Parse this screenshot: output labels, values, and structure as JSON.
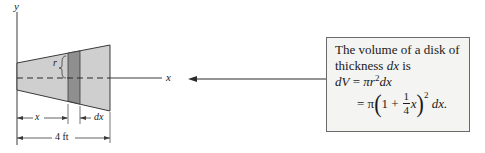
{
  "figure": {
    "axes": {
      "y_label": "y",
      "x_label": "x"
    },
    "annotations": {
      "radius_label": "r",
      "x_dim_label": "x",
      "dx_dim_label": "dx",
      "total_length_label": "4 ft"
    },
    "colors": {
      "solid_fill": "#cfcfcf",
      "disk_fill": "#8f8f8f",
      "outline": "#3a3a3a",
      "callout_bg": "#f4f4f2",
      "callout_border": "#6a6a6a"
    }
  },
  "callout": {
    "line1": "The volume of a disk of",
    "line2_prefix": "thickness ",
    "line2_var": "dx",
    "line2_suffix": " is",
    "eq1_lhs": "dV",
    "eq1_eq": " = ",
    "eq1_rhs_pi": "π",
    "eq1_rhs_r": "r",
    "eq1_rhs_exp": "2",
    "eq1_rhs_dx": "dx",
    "eq2_eq": "= π",
    "eq2_open": "(",
    "eq2_one_plus": "1 + ",
    "eq2_frac_num": "1",
    "eq2_frac_den": "4",
    "eq2_x": "x",
    "eq2_close": ")",
    "eq2_exp": "2",
    "eq2_tail": " dx."
  }
}
